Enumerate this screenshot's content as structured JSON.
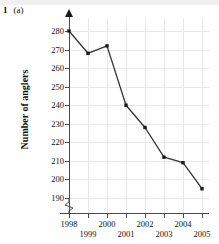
{
  "question": {
    "number": "1",
    "part": "(a)"
  },
  "chart_data": {
    "type": "line",
    "title": "",
    "xlabel": "",
    "ylabel": "Number of anglers",
    "categories": [
      "1998",
      "1999",
      "2000",
      "2001",
      "2002",
      "2003",
      "2004",
      "2005"
    ],
    "values": [
      280,
      268,
      272,
      240,
      228,
      212,
      209,
      195
    ],
    "x_tick_labels": [
      "1998",
      "1999",
      "2000",
      "2001",
      "2002",
      "2003",
      "2004",
      "2005"
    ],
    "y_tick_labels": [
      "190",
      "200",
      "210",
      "220",
      "230",
      "240",
      "250",
      "260",
      "270",
      "280"
    ],
    "ylim": [
      190,
      285
    ],
    "y_tick_step": 10,
    "y_axis_break": true,
    "grid": true,
    "legend": false,
    "marker": "square",
    "line_color": "#333333",
    "grid_color": "#e8e8e8",
    "axis_color": "#4a4a4a",
    "background": "#ffffff"
  }
}
